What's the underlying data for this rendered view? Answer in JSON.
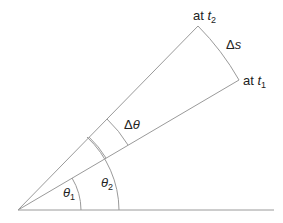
{
  "diagram": {
    "type": "angular-displacement",
    "colors": {
      "line": "#9a9a9a",
      "text": "#222222",
      "background": "#ffffff"
    },
    "labels": {
      "at_t2": {
        "prefix": "at ",
        "var": "t",
        "sub": "2"
      },
      "at_t1": {
        "prefix": "at ",
        "var": "t",
        "sub": "1"
      },
      "delta_s": {
        "delta": "Δ",
        "var": "s"
      },
      "delta_theta": {
        "delta": "Δ",
        "var": "θ"
      },
      "theta1": {
        "var": "θ",
        "sub": "1"
      },
      "theta2": {
        "var": "θ",
        "sub": "2"
      }
    }
  }
}
